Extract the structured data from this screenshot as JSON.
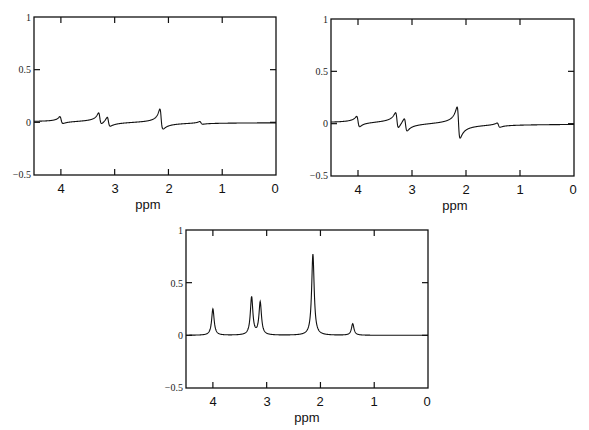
{
  "chart_data": [
    {
      "type": "line",
      "title": "",
      "xlabel": "ppm",
      "ylabel": "",
      "xlim": [
        4.5,
        0
      ],
      "ylim": [
        -0.5,
        1
      ],
      "xticks": [
        4,
        3,
        2,
        1,
        0
      ],
      "yticks": [
        1,
        0.5,
        0,
        -0.5
      ],
      "ytick_labels": [
        "1",
        "0.5",
        "0",
        "−0.5"
      ],
      "grid": false,
      "phase": "mixed absorption/dispersion",
      "peaks": [
        {
          "ppm": 4.0,
          "max": 0.17,
          "min": -0.01
        },
        {
          "ppm": 3.28,
          "max": 0.28,
          "min": 0.01
        },
        {
          "ppm": 3.12,
          "max": 0.2,
          "min": -0.06
        },
        {
          "ppm": 2.14,
          "max": 0.49,
          "min": -0.1
        },
        {
          "ppm": 1.4,
          "max": 0.06,
          "min": -0.02
        }
      ],
      "sim": {
        "amps": [
          0.055,
          0.09,
          0.075,
          0.16,
          0.022
        ],
        "width": 0.028,
        "mix": 0.55
      }
    },
    {
      "type": "line",
      "title": "",
      "xlabel": "ppm",
      "ylabel": "",
      "xlim": [
        4.5,
        0
      ],
      "ylim": [
        -0.5,
        1
      ],
      "xticks": [
        4,
        3,
        2,
        1,
        0
      ],
      "yticks": [
        1,
        0.5,
        0,
        -0.5
      ],
      "ytick_labels": [
        "1",
        "0.5",
        "0",
        "−0.5"
      ],
      "grid": false,
      "phase": "predominantly dispersion",
      "peaks": [
        {
          "ppm": 4.0,
          "max": 0.14,
          "min": 0.0
        },
        {
          "ppm": 3.28,
          "max": 0.21,
          "min": 0.02
        },
        {
          "ppm": 3.12,
          "max": 0.16,
          "min": -0.04
        },
        {
          "ppm": 2.14,
          "max": 0.27,
          "min": -0.18
        },
        {
          "ppm": 1.4,
          "max": 0.01,
          "min": -0.04
        }
      ],
      "sim": {
        "amps": [
          0.06,
          0.09,
          0.075,
          0.18,
          0.025
        ],
        "width": 0.028,
        "mix": 0.82
      }
    },
    {
      "type": "line",
      "title": "",
      "xlabel": "ppm",
      "ylabel": "",
      "xlim": [
        4.5,
        0
      ],
      "ylim": [
        -0.5,
        1
      ],
      "xticks": [
        4,
        3,
        2,
        1,
        0
      ],
      "yticks": [
        1,
        0.5,
        0,
        -0.5
      ],
      "ytick_labels": [
        "1",
        "0.5",
        "0",
        "−0.5"
      ],
      "grid": false,
      "phase": "pure absorption",
      "peaks": [
        {
          "ppm": 4.0,
          "height": 0.25
        },
        {
          "ppm": 3.28,
          "height": 0.39
        },
        {
          "ppm": 3.12,
          "height": 0.34
        },
        {
          "ppm": 2.14,
          "height": 0.77
        },
        {
          "ppm": 1.4,
          "height": 0.11
        }
      ],
      "sim": {
        "amps": [
          0.25,
          0.36,
          0.31,
          0.77,
          0.11
        ],
        "width": 0.028,
        "mix": 0.0
      }
    }
  ],
  "panels": [
    {
      "xlabel": "ppm",
      "xtick_labels": [
        "4",
        "3",
        "2",
        "1",
        "0"
      ],
      "ytick_labels": [
        "1",
        "0.5",
        "0",
        "−0.5"
      ]
    },
    {
      "xlabel": "ppm",
      "xtick_labels": [
        "4",
        "3",
        "2",
        "1",
        "0"
      ],
      "ytick_labels": [
        "1",
        "0.5",
        "0",
        "−0.5"
      ]
    },
    {
      "xlabel": "ppm",
      "xtick_labels": [
        "4",
        "3",
        "2",
        "1",
        "0"
      ],
      "ytick_labels": [
        "1",
        "0.5",
        "0",
        "−0.5"
      ]
    }
  ]
}
